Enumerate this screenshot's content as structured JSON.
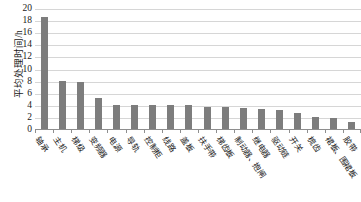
{
  "chart_data": {
    "type": "bar",
    "title": "",
    "xlabel": "",
    "ylabel": "平均处理时间/h",
    "ylim": [
      0,
      20
    ],
    "ytick_step": 2,
    "yticks": [
      20,
      18,
      16,
      14,
      12,
      10,
      8,
      6,
      4,
      2,
      0
    ],
    "grid": true,
    "legend": "none",
    "bar_color": "#7d7d7d",
    "gridline_color": "#d6d6d6",
    "axis_color": "#8e8e8e",
    "background_color": "#ffffff",
    "categories": [
      "轴承",
      "主机",
      "梯级",
      "变频器",
      "电源",
      "导轨",
      "控制柜",
      "线路",
      "盖板",
      "扶手带",
      "梯齿板",
      "制动器、抱闸",
      "继电器",
      "驱动链",
      "开关",
      "梳齿",
      "裙板、围裙板",
      "胶带"
    ],
    "values": [
      18.5,
      8.0,
      7.7,
      5.2,
      4.0,
      4.0,
      4.0,
      3.9,
      3.9,
      3.7,
      3.6,
      3.5,
      3.3,
      3.1,
      2.6,
      2.0,
      1.8,
      1.1
    ]
  }
}
